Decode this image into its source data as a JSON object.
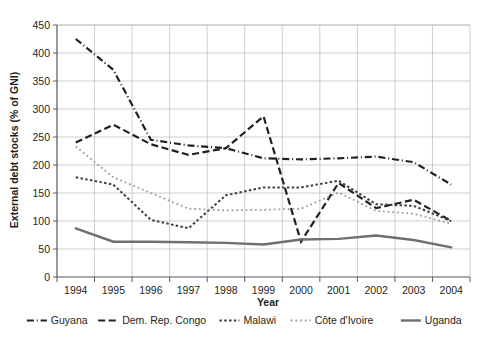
{
  "chart_data": {
    "type": "line",
    "title": "",
    "xlabel": "Year",
    "ylabel": "External debt stocks (% of GNI)",
    "x": [
      1994,
      1995,
      1996,
      1997,
      1998,
      1999,
      2000,
      2001,
      2002,
      2003,
      2004
    ],
    "xtick_labels": [
      "1994",
      "1995",
      "1996",
      "1997",
      "1998",
      "1999",
      "2000",
      "2001",
      "2002",
      "2003",
      "2004"
    ],
    "ytick_labels": [
      "0",
      "50",
      "100",
      "150",
      "200",
      "250",
      "300",
      "350",
      "400",
      "450"
    ],
    "ylim": [
      0,
      450
    ],
    "ytick_step": 50,
    "grid": "both",
    "legend_position": "bottom",
    "series": [
      {
        "name": "Guyana",
        "style": "dash-dot",
        "color": "#231f20",
        "width": 2.2,
        "values": [
          425,
          370,
          245,
          235,
          230,
          212,
          210,
          212,
          215,
          205,
          165
        ]
      },
      {
        "name": "Dem. Rep. Congo",
        "style": "dashed",
        "color": "#231f20",
        "width": 2.2,
        "values": [
          240,
          272,
          237,
          218,
          230,
          287,
          63,
          168,
          123,
          138,
          100
        ]
      },
      {
        "name": "Malawi",
        "style": "dotted-bold",
        "color": "#3f3f41",
        "width": 2.0,
        "values": [
          178,
          165,
          102,
          87,
          146,
          160,
          160,
          172,
          130,
          127,
          100
        ]
      },
      {
        "name": "Côte d'Ivoire",
        "style": "dotted-fine",
        "color": "#9c9c9e",
        "width": 1.8,
        "values": [
          233,
          178,
          150,
          122,
          119,
          120,
          122,
          151,
          118,
          113,
          95
        ]
      },
      {
        "name": "Uganda",
        "style": "solid",
        "color": "#6f6f71",
        "width": 2.4,
        "values": [
          87,
          63,
          63,
          62,
          61,
          58,
          67,
          68,
          74,
          66,
          53
        ]
      }
    ]
  },
  "axes": {
    "y_axis_title": "External debt stocks (% of GNI)",
    "x_axis_title": "Year"
  },
  "legend": {
    "items": [
      {
        "label": "Guyana"
      },
      {
        "label": "Dem. Rep. Congo"
      },
      {
        "label": "Malawi"
      },
      {
        "label": "Côte d'Ivoire"
      },
      {
        "label": "Uganda"
      }
    ]
  }
}
